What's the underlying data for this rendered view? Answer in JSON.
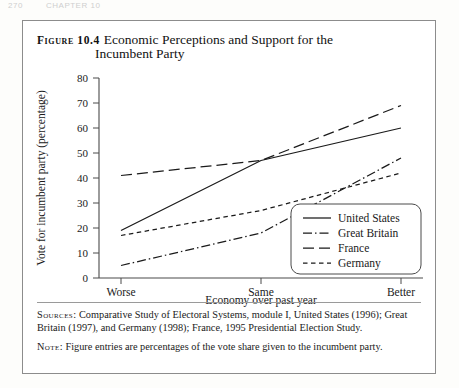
{
  "page_header": {
    "page_number": "270",
    "running_title": "CHAPTER 10"
  },
  "figure": {
    "label": "Figure 10.4",
    "title_line1": "Economic Perceptions and Support for the",
    "title_line2": "Incumbent Party"
  },
  "sources": {
    "label": "Sources:",
    "text_line1": "Comparative Study of Electoral Systems, module I, United States (1996);",
    "text_line2": "Great Britain (1997), and Germany (1998); France, 1995 Presidential Election Study."
  },
  "note": {
    "label": "Note:",
    "text": "Figure entries are percentages of the vote share given to the incumbent party."
  },
  "chart_data": {
    "type": "line",
    "title": "Economic Perceptions and Support for the Incumbent Party",
    "xlabel": "Economy over past year",
    "ylabel": "Vote for incumbent party (percentage)",
    "categories": [
      "Worse",
      "Same",
      "Better"
    ],
    "ylim": [
      0,
      80
    ],
    "yticks": [
      0,
      10,
      20,
      30,
      40,
      50,
      60,
      70,
      80
    ],
    "ytick_labels": [
      "0",
      "10",
      "20",
      "30",
      "40",
      "50",
      "60",
      "70",
      "80"
    ],
    "grid": false,
    "legend_position": "bottom-right",
    "series": [
      {
        "name": "United States",
        "values": [
          19,
          47,
          60
        ],
        "style": "solid"
      },
      {
        "name": "Great Britain",
        "values": [
          5,
          18,
          48
        ],
        "style": "dashdot"
      },
      {
        "name": "France",
        "values": [
          41,
          47,
          69
        ],
        "style": "longdash"
      },
      {
        "name": "Germany",
        "values": [
          17,
          27,
          42
        ],
        "style": "shortdash"
      }
    ],
    "line_color": "#1a1a1a",
    "axis_color": "#4a4a4a"
  }
}
